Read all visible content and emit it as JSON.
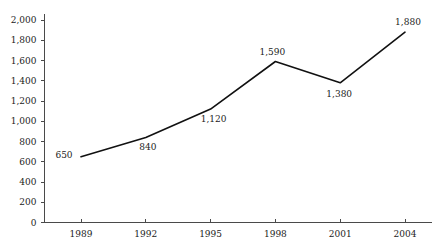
{
  "chart_data": {
    "type": "line",
    "title": "",
    "subtitle": "",
    "xlabel": "",
    "ylabel": "",
    "categories": [
      "1989",
      "1992",
      "1995",
      "1998",
      "2001",
      "2004"
    ],
    "values": [
      650,
      840,
      1120,
      1590,
      1380,
      1880
    ],
    "point_labels": [
      "650",
      "840",
      "1,120",
      "1,590",
      "1,380",
      "1,880"
    ],
    "ylim": [
      0,
      2000
    ],
    "ytick_values": [
      0,
      200,
      400,
      600,
      800,
      1000,
      1200,
      1400,
      1600,
      1800,
      2000
    ],
    "ytick_labels": [
      "0",
      "200",
      "400",
      "600",
      "800",
      "1,000",
      "1,200",
      "1,400",
      "1,600",
      "1,800",
      "2,000"
    ],
    "grid": false,
    "legend": false,
    "legend_position": "none",
    "series": [
      {
        "name": "",
        "values": [
          650,
          840,
          1120,
          1590,
          1380,
          1880
        ],
        "color": "#111111"
      }
    ],
    "colors": {
      "line": "#111111",
      "axis": "#4a4a4a",
      "text": "#1c1c1c",
      "background": "#ffffff"
    }
  }
}
